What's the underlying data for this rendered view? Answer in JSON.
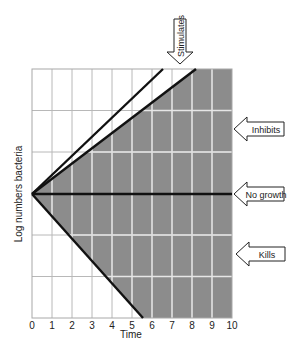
{
  "diagram": {
    "x_axis": {
      "label": "Time",
      "ticks": [
        "0",
        "1",
        "2",
        "3",
        "4",
        "5",
        "6",
        "7",
        "8",
        "9",
        "10"
      ]
    },
    "y_axis": {
      "label": "Log numbers bacteria"
    },
    "callouts": {
      "stimulates": "Stimulates",
      "inhibits": "Inhibits",
      "no_growth": "No growth",
      "kills": "Kills"
    },
    "colors": {
      "shaded_region": "#8c8c8c",
      "grid_on_white": "#b8b8b8",
      "grid_on_shade": "#e6e6e6",
      "line": "#111111",
      "text": "#222222"
    }
  },
  "chart_data": {
    "type": "line",
    "title": "",
    "xlabel": "Time",
    "ylabel": "Log numbers bacteria",
    "xlim": [
      0,
      10
    ],
    "grid": true,
    "series": [
      {
        "name": "Stimulates (upper line)",
        "x": [
          0,
          6.55
        ],
        "y": [
          0,
          3
        ]
      },
      {
        "name": "Stimulates (lower line)",
        "x": [
          0,
          8.2
        ],
        "y": [
          0,
          3
        ]
      },
      {
        "name": "No growth",
        "x": [
          0,
          10
        ],
        "y": [
          0,
          0
        ]
      },
      {
        "name": "Kills boundary",
        "x": [
          0,
          5.55
        ],
        "y": [
          0,
          -3
        ]
      }
    ],
    "regions": [
      {
        "name": "Inhibits",
        "description": "shaded between lower stimulates line and no-growth line"
      },
      {
        "name": "Kills",
        "description": "shaded between no-growth line and kills boundary"
      }
    ],
    "annotations": [
      "Stimulates",
      "Inhibits",
      "No growth",
      "Kills"
    ]
  }
}
